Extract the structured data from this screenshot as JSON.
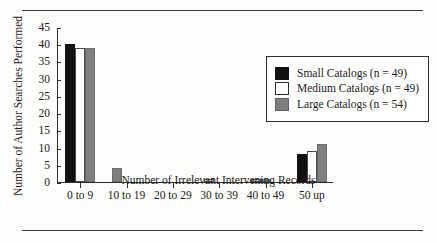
{
  "figure": {
    "has_top_rule": true,
    "has_bottom_rule": true,
    "background_color": "#fdfdfc"
  },
  "legend": {
    "position": "upper-right",
    "entries": [
      {
        "label": "Small Catalogs (n = 49)",
        "color": "#111111",
        "key": "small"
      },
      {
        "label": "Medium Catalogs (n = 49)",
        "color": "#ffffff",
        "key": "medium"
      },
      {
        "label": "Large Catalogs (n = 54)",
        "color": "#7f7f7f",
        "key": "large"
      }
    ]
  },
  "chart_data": {
    "type": "bar",
    "title": "",
    "xlabel": "Number of Irrelevant Intervening Records",
    "ylabel": "Number of Author Searches Performed",
    "categories": [
      "0 to 9",
      "10 to 19",
      "20 to 29",
      "30 to 39",
      "40 to 49",
      "50 up"
    ],
    "series": [
      {
        "name": "Small Catalogs (n = 49)",
        "color": "#111111",
        "values": [
          40,
          0,
          0,
          0,
          0,
          8
        ]
      },
      {
        "name": "Medium Catalogs (n = 49)",
        "color": "#ffffff",
        "values": [
          39,
          0,
          0,
          1,
          1,
          9
        ]
      },
      {
        "name": "Large Catalogs (n = 54)",
        "color": "#7f7f7f",
        "values": [
          39,
          4,
          0,
          0,
          1,
          11
        ]
      }
    ],
    "ylim": [
      0,
      45
    ],
    "yticks": [
      0,
      5,
      10,
      15,
      20,
      25,
      30,
      35,
      40,
      45
    ],
    "ytick_labels": [
      "0",
      "5",
      "10",
      "15",
      "20",
      "25",
      "30",
      "35",
      "40",
      "45"
    ],
    "grid": false,
    "legend_position": "upper right"
  }
}
